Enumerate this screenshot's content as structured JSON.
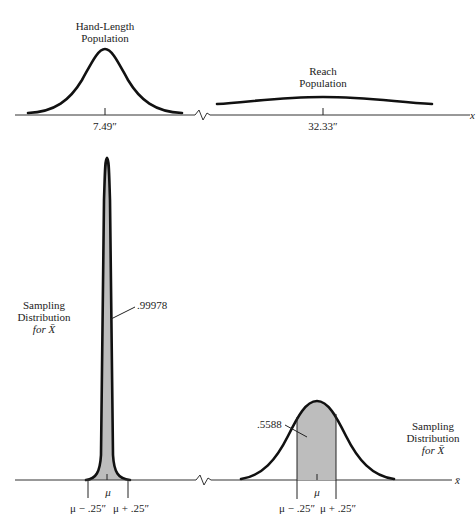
{
  "top_panel": {
    "hand_length": {
      "title_line1": "Hand-Length",
      "title_line2": "Population",
      "mean_label": "7.49″"
    },
    "reach": {
      "title_line1": "Reach",
      "title_line2": "Population",
      "mean_label": "32.33″"
    },
    "axis_label": "x"
  },
  "bottom_panel": {
    "left": {
      "title_line1": "Sampling",
      "title_line2": "Distribution",
      "title_line3": "for X̄",
      "probability_label": ".99978",
      "mu_label": "μ",
      "lower_label": "μ − .25″",
      "upper_label": "μ + .25″"
    },
    "right": {
      "title_line1": "Sampling",
      "title_line2": "Distribution",
      "title_line3": "for X̄",
      "probability_label": ".5588",
      "mu_label": "μ",
      "lower_label": "μ − .25″",
      "upper_label": "μ + .25″"
    },
    "axis_label": "x̄"
  },
  "colors": {
    "curve": "#111111",
    "shade": "#bdbdbd",
    "axis": "#333333"
  }
}
